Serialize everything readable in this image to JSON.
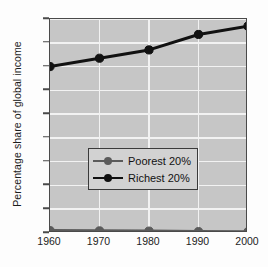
{
  "chart_data": {
    "type": "line",
    "title": "",
    "xlabel": "",
    "ylabel": "Percentage share of global income",
    "x": [
      1960,
      1970,
      1980,
      1990,
      2000
    ],
    "xtick_labels": [
      "1960",
      "1970",
      "1980",
      "1990",
      "2000"
    ],
    "ytick_labels": [
      "0",
      "10",
      "20",
      "30",
      "40",
      "50",
      "60",
      "70",
      "80",
      "90"
    ],
    "yticks": [
      0,
      10,
      20,
      30,
      40,
      50,
      60,
      70,
      80,
      90
    ],
    "ylim": [
      0,
      90
    ],
    "xlim": [
      1960,
      2000
    ],
    "grid": "horizontal-and-vertical-white",
    "legend_position": "center-left",
    "series": [
      {
        "name": "Poorest 20%",
        "values": [
          1.0,
          0.9,
          0.8,
          0.6,
          0.5
        ],
        "color": "#5b5b5b",
        "marker": "circle"
      },
      {
        "name": "Richest 20%",
        "values": [
          70.0,
          73.5,
          77.0,
          83.5,
          87.0
        ],
        "color": "#111111",
        "marker": "circle"
      }
    ]
  },
  "colors": {
    "plot_background": "#c6c6c6",
    "gridline": "#f2f2f2",
    "axis_border": "#4a4a4a",
    "figure_background": "#fdfdfd",
    "legend_background": "#d2d2d2",
    "legend_border": "#3a3a3a",
    "text": "#1c1c1c"
  },
  "legend": {
    "items": [
      {
        "label": "Poorest 20%"
      },
      {
        "label": "Richest 20%"
      }
    ]
  }
}
